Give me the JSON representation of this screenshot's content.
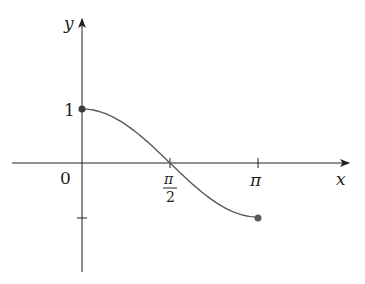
{
  "chart_data": {
    "type": "line",
    "title": "",
    "xlabel": "x",
    "ylabel": "y",
    "function": "cos(x)",
    "domain": [
      0,
      3.14159
    ],
    "x_ticks": [
      {
        "value": 0,
        "label": "0"
      },
      {
        "value": 1.5708,
        "label_num": "π",
        "label_den": "2"
      },
      {
        "value": 3.14159,
        "label": "π"
      }
    ],
    "y_ticks": [
      {
        "value": 1,
        "label": "1"
      },
      {
        "value": -1,
        "label": ""
      }
    ],
    "endpoints": [
      {
        "x": 0,
        "y": 1,
        "filled": true
      },
      {
        "x": 3.14159,
        "y": -1,
        "filled": true
      }
    ],
    "grid": false,
    "legend": null,
    "colors": {
      "axis": "#231f20",
      "curve": "#58595b",
      "points": "#58595b"
    }
  }
}
